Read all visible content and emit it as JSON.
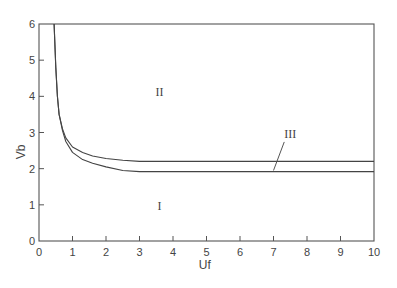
{
  "chart_data": {
    "type": "line",
    "title": "",
    "xlabel": "Uf",
    "ylabel": "Vb",
    "xlim": [
      0,
      10
    ],
    "ylim": [
      0,
      6
    ],
    "x_ticks": [
      "0",
      "1",
      "2",
      "3",
      "4",
      "5",
      "6",
      "7",
      "8",
      "9",
      "10"
    ],
    "y_ticks": [
      "0",
      "1",
      "2",
      "3",
      "4",
      "5",
      "6"
    ],
    "grid": false,
    "legend": null,
    "regions": [
      {
        "label": "I",
        "x": 3.6,
        "y": 0.85
      },
      {
        "label": "II",
        "x": 3.6,
        "y": 4.0
      },
      {
        "label": "III",
        "x": 7.5,
        "y": 2.85,
        "leader_to": {
          "x": 7.0,
          "y": 1.95
        }
      }
    ],
    "series": [
      {
        "name": "upper boundary (II / III)",
        "x": [
          0.45,
          0.5,
          0.55,
          0.6,
          0.7,
          0.8,
          1.0,
          1.3,
          1.6,
          2.0,
          2.5,
          3.0,
          4.0,
          5.0,
          6.0,
          7.0,
          8.0,
          9.0,
          10.0
        ],
        "y": [
          6.0,
          4.8,
          4.0,
          3.5,
          3.1,
          2.85,
          2.6,
          2.45,
          2.35,
          2.28,
          2.23,
          2.2,
          2.2,
          2.2,
          2.2,
          2.2,
          2.2,
          2.2,
          2.2
        ]
      },
      {
        "name": "lower boundary (I / III)",
        "x": [
          0.45,
          0.5,
          0.55,
          0.6,
          0.7,
          0.8,
          1.0,
          1.3,
          1.6,
          2.0,
          2.5,
          3.0,
          4.0,
          5.0,
          6.0,
          7.0,
          8.0,
          9.0,
          10.0
        ],
        "y": [
          6.0,
          4.8,
          4.0,
          3.5,
          3.05,
          2.75,
          2.45,
          2.25,
          2.15,
          2.05,
          1.95,
          1.92,
          1.92,
          1.92,
          1.92,
          1.92,
          1.92,
          1.92,
          1.92
        ]
      }
    ]
  }
}
